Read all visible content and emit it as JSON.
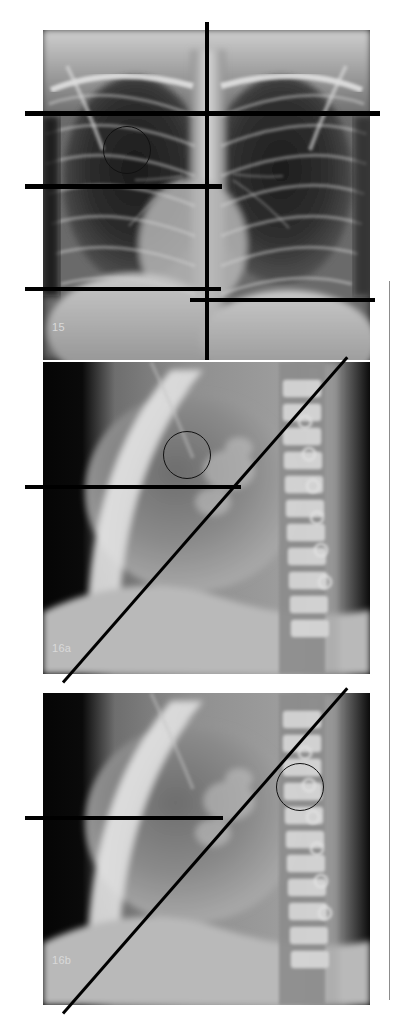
{
  "figure": {
    "type": "radiology-figure",
    "width": 397,
    "height": 1029,
    "background": "#ffffff",
    "modality": "chest-radiograph"
  },
  "panels": [
    {
      "id": "panel-15",
      "label": "15",
      "view": "PA",
      "x": 43,
      "y": 30,
      "width": 327,
      "height": 330,
      "label_x": 52,
      "label_y": 322,
      "roi": {
        "cx": 127,
        "cy": 150,
        "r": 24
      }
    },
    {
      "id": "panel-16a",
      "label": "16a",
      "view": "lateral",
      "x": 43,
      "y": 362,
      "width": 327,
      "height": 312,
      "label_x": 52,
      "label_y": 643,
      "roi": {
        "cx": 187,
        "cy": 455,
        "r": 24
      }
    },
    {
      "id": "panel-16b",
      "label": "16b",
      "view": "lateral",
      "x": 43,
      "y": 693,
      "width": 327,
      "height": 312,
      "label_x": 52,
      "label_y": 955,
      "roi": {
        "cx": 300,
        "cy": 787,
        "r": 24
      }
    }
  ],
  "annotations": {
    "horizontal_lines": [
      {
        "name": "line-apex-pa",
        "x": 25,
        "y": 111,
        "width": 355,
        "height": 5
      },
      {
        "name": "line-mid-pa",
        "x": 25,
        "y": 184,
        "width": 197,
        "height": 5
      },
      {
        "name": "line-lower-left-pa",
        "x": 25,
        "y": 287,
        "width": 196,
        "height": 4
      },
      {
        "name": "line-lower-right-pa",
        "x": 190,
        "y": 298,
        "width": 185,
        "height": 4
      },
      {
        "name": "line-lateral-16a",
        "x": 25,
        "y": 485,
        "width": 216,
        "height": 4
      },
      {
        "name": "line-lateral-16b",
        "x": 25,
        "y": 816,
        "width": 198,
        "height": 4
      }
    ],
    "vertical_lines": [
      {
        "name": "midline-pa",
        "x": 205,
        "y": 22,
        "width": 4,
        "height": 338
      }
    ],
    "thin_rules": [
      {
        "name": "margin-rule-right",
        "x": 389,
        "y": 281,
        "width": 1,
        "height": 719
      }
    ],
    "diagonal_lines": [
      {
        "name": "diagonal-axis-16a",
        "x1": 63,
        "y1": 682,
        "x2": 347,
        "y2": 357,
        "thickness": 3
      },
      {
        "name": "diagonal-axis-16b",
        "x1": 63,
        "y1": 1013,
        "x2": 347,
        "y2": 688,
        "thickness": 3
      }
    ]
  },
  "colors": {
    "annotation": "#000000",
    "thin_rule": "#8c8c8c",
    "label_text": "#d9d9d9",
    "page_background": "#ffffff"
  }
}
